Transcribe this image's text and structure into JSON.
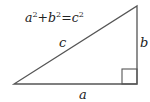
{
  "diagram": {
    "formula": {
      "a": "a",
      "b": "b",
      "c": "c",
      "exp": "2",
      "plus": "+",
      "equals": "="
    },
    "labels": {
      "hypotenuse": "c",
      "vertical_leg": "b",
      "horizontal_leg": "a"
    },
    "shape": "right-triangle",
    "right_angle_marker": true,
    "colors": {
      "stroke": "#555555",
      "text": "#222222",
      "background": "#ffffff"
    }
  }
}
